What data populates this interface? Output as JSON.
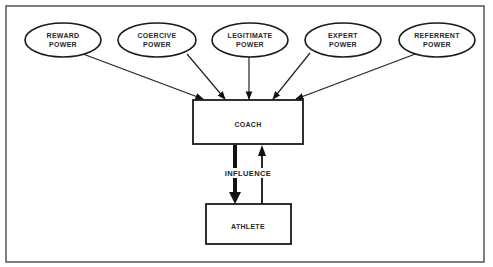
{
  "diagram": {
    "title": "",
    "power_sources": [
      {
        "id": "reward",
        "line1": "REWARD",
        "line2": "POWER"
      },
      {
        "id": "coercive",
        "line1": "COERCIVE",
        "line2": "POWER"
      },
      {
        "id": "legitimate",
        "line1": "LEGITIMATE",
        "line2": "POWER"
      },
      {
        "id": "expert",
        "line1": "EXPERT",
        "line2": "POWER"
      },
      {
        "id": "referrent",
        "line1": "REFERRENT",
        "line2": "POWER"
      }
    ],
    "coach": {
      "label": "COACH"
    },
    "athlete": {
      "label": "ATHLETE"
    },
    "influence": {
      "label": "INFLUENCE"
    },
    "edges": [
      {
        "from": "reward",
        "to": "coach"
      },
      {
        "from": "coercive",
        "to": "coach"
      },
      {
        "from": "legitimate",
        "to": "coach"
      },
      {
        "from": "expert",
        "to": "coach"
      },
      {
        "from": "referrent",
        "to": "coach"
      },
      {
        "from": "coach",
        "to": "athlete",
        "style": "thick",
        "label": "INFLUENCE"
      },
      {
        "from": "athlete",
        "to": "coach",
        "style": "thin"
      }
    ]
  }
}
